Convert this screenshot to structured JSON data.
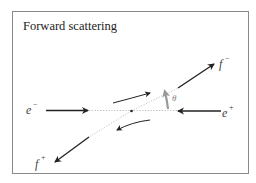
{
  "title": "Forward scattering",
  "colors": {
    "frame": "#8a8a8a",
    "arrow": "#222222",
    "dotted": "#bbbbbb",
    "theta_arrow": "#999999",
    "text": "#333333"
  },
  "particles": {
    "incoming_left": {
      "symbol": "e",
      "charge": "−",
      "name": "electron"
    },
    "incoming_right": {
      "symbol": "e",
      "charge": "+",
      "name": "positron"
    },
    "outgoing_upper_right": {
      "symbol": "f",
      "charge": "−",
      "name": "fermion"
    },
    "outgoing_lower_left": {
      "symbol": "f",
      "charge": "+",
      "name": "antifermion"
    }
  },
  "angle": {
    "symbol": "θ"
  }
}
